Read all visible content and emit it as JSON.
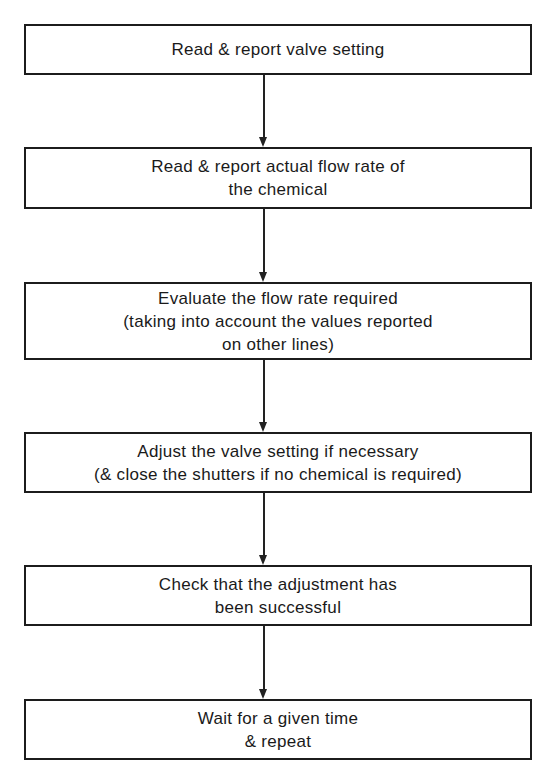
{
  "diagram": {
    "type": "flowchart",
    "direction": "top-to-bottom",
    "steps": [
      {
        "id": 1,
        "label": "Read & report valve setting"
      },
      {
        "id": 2,
        "label": "Read & report actual flow rate of\nthe chemical"
      },
      {
        "id": 3,
        "label": "Evaluate the flow rate required\n(taking into account the values reported\non other lines)"
      },
      {
        "id": 4,
        "label": "Adjust the valve setting if necessary\n(& close the shutters if no chemical is required)"
      },
      {
        "id": 5,
        "label": "Check that the adjustment has\nbeen successful"
      },
      {
        "id": 6,
        "label": "Wait for a given time\n& repeat"
      }
    ],
    "edges": [
      {
        "from": 1,
        "to": 2
      },
      {
        "from": 2,
        "to": 3
      },
      {
        "from": 3,
        "to": 4
      },
      {
        "from": 4,
        "to": 5
      },
      {
        "from": 5,
        "to": 6
      }
    ],
    "colors": {
      "stroke": "#1c1c1c",
      "background": "#ffffff",
      "text": "#1a1a1a"
    }
  }
}
